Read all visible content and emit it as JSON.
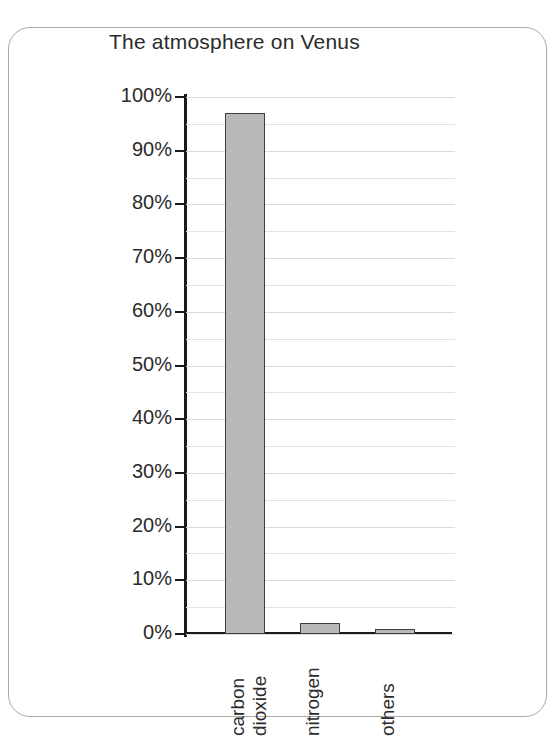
{
  "figure": {
    "title": "The atmosphere on Venus",
    "border_color": "#a9a9a9",
    "background": "#ffffff"
  },
  "chart_data": {
    "type": "bar",
    "title": "The atmosphere on Venus",
    "xlabel": "",
    "ylabel": "",
    "categories": [
      "carbon dioxide",
      "nitrogen",
      "others"
    ],
    "category_lines": [
      [
        "carbon",
        "dioxide"
      ],
      [
        "nitrogen"
      ],
      [
        "others"
      ]
    ],
    "values": [
      97,
      2,
      1
    ],
    "value_unit": "%",
    "ylim": [
      0,
      100
    ],
    "ytick_labels": [
      "0%",
      "10%",
      "20%",
      "30%",
      "40%",
      "50%",
      "60%",
      "70%",
      "80%",
      "90%",
      "100%"
    ],
    "ytick_values": [
      0,
      10,
      20,
      30,
      40,
      50,
      60,
      70,
      80,
      90,
      100
    ],
    "minor_tick_interval": 5,
    "grid": true,
    "grid_axis": "y",
    "legend": false,
    "bar_fill_color": "#b9b9b9",
    "bar_edge_color": "#3d3d3d",
    "axis_color": "#1a1a1a",
    "grid_color": "#e2e2e2"
  }
}
